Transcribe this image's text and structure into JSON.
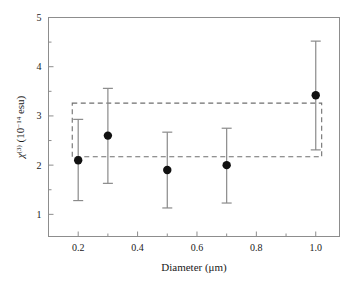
{
  "chart_data": {
    "type": "scatter",
    "title": "",
    "subtitle": "",
    "xlabel": "Diameter (μm)",
    "ylabel": "χ(3) (10−14 esu)",
    "ylabel_parts": {
      "symbol": "χ",
      "symbol_sup": "(3)",
      "unit_open": " (10",
      "unit_exp": "−14",
      "unit_close": " esu)"
    },
    "xlim": [
      0.1,
      1.08
    ],
    "ylim": [
      0.55,
      5.0
    ],
    "grid": false,
    "legend": "none",
    "x_ticks_major": [
      0.2,
      0.4,
      0.6,
      0.8,
      1.0
    ],
    "x_tick_labels": [
      "0.2",
      "0.4",
      "0.6",
      "0.8",
      "1.0"
    ],
    "x_ticks_minor": [
      0.3,
      0.5,
      0.7,
      0.9
    ],
    "y_ticks_major": [
      1,
      2,
      3,
      4,
      5
    ],
    "y_tick_labels": [
      "1",
      "2",
      "3",
      "4",
      "5"
    ],
    "y_ticks_minor": [
      1.5,
      2.5,
      3.5,
      4.5
    ],
    "marker": "filled-circle",
    "marker_color": "#111111",
    "errorbar_color": "#8a8a8a",
    "series": [
      {
        "name": "chi3 vs diameter",
        "x": [
          0.2,
          0.3,
          0.5,
          0.7,
          1.0
        ],
        "y": [
          2.1,
          2.6,
          1.9,
          2.0,
          3.42
        ],
        "yerr_lower": [
          0.82,
          0.97,
          0.77,
          0.77,
          1.11
        ],
        "yerr_upper": [
          0.83,
          0.96,
          0.77,
          0.75,
          1.1
        ]
      }
    ],
    "annotations": [
      {
        "kind": "dashed-rectangle",
        "x0": 0.18,
        "x1": 1.02,
        "y0": 2.17,
        "y1": 3.26,
        "color": "#6f6f6f",
        "linestyle": "dashed"
      }
    ]
  },
  "figure": {
    "frame_color": "#8d8d8d",
    "background": "#ffffff"
  }
}
